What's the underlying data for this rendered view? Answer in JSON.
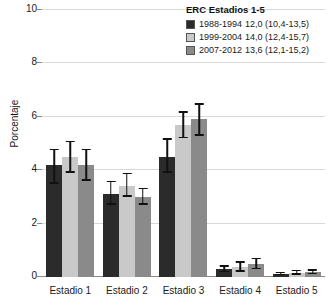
{
  "chart_data": {
    "type": "bar",
    "title": "",
    "xlabel": "",
    "ylabel": "Porcentaje",
    "ylim": [
      0,
      10
    ],
    "yticks": [
      0,
      2,
      4,
      6,
      8,
      10
    ],
    "ytick_labels": [
      "0",
      "2",
      "4",
      "6",
      "8",
      "10"
    ],
    "grid": true,
    "legend_position": "top-right",
    "legend_title": "ERC Estadios 1-5",
    "categories": [
      "Estadio 1",
      "Estadio 2",
      "Estadio 3",
      "Estadio 4",
      "Estadio 5"
    ],
    "series": [
      {
        "name": "1988-1994",
        "color": "#2b2b2b",
        "overall_value": "12,0 (10,4-13,5)",
        "values": [
          4.2,
          3.1,
          4.5,
          0.3,
          0.12
        ],
        "err_low": [
          3.5,
          2.7,
          3.9,
          0.18,
          0.06
        ],
        "err_high": [
          4.8,
          3.6,
          5.2,
          0.45,
          0.2
        ]
      },
      {
        "name": "1999-2004",
        "color": "#c9c9c9",
        "overall_value": "14,0 (12,4-15,7)",
        "values": [
          4.5,
          3.4,
          5.7,
          0.38,
          0.16
        ],
        "err_low": [
          3.9,
          3.0,
          5.2,
          0.2,
          0.08
        ],
        "err_high": [
          5.1,
          3.9,
          6.2,
          0.6,
          0.28
        ]
      },
      {
        "name": "2007-2012",
        "color": "#8a8a8a",
        "overall_value": "13,6 (12,1-15,2)",
        "values": [
          4.2,
          3.0,
          5.9,
          0.5,
          0.18
        ],
        "err_low": [
          3.6,
          2.7,
          5.3,
          0.3,
          0.1
        ],
        "err_high": [
          4.8,
          3.35,
          6.5,
          0.72,
          0.3
        ]
      }
    ]
  }
}
